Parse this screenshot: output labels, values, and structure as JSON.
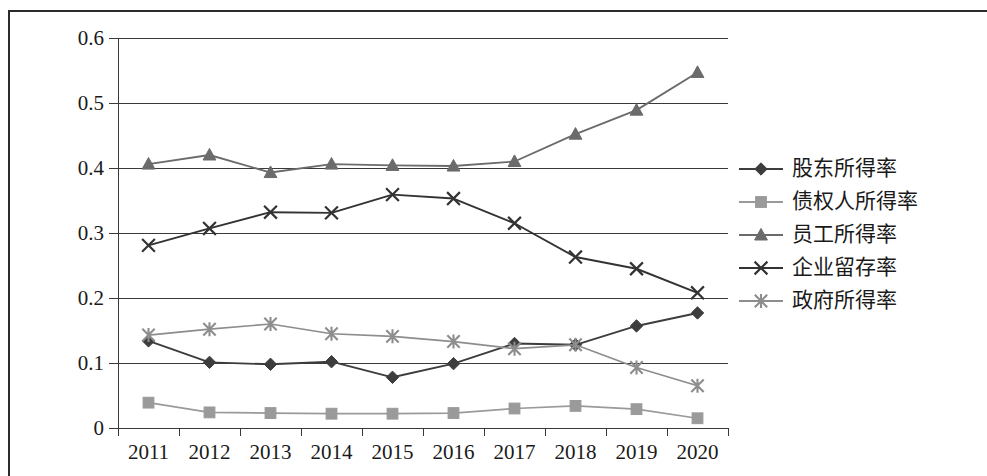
{
  "chart_data": {
    "type": "line",
    "title": "",
    "xlabel": "",
    "ylabel": "",
    "categories": [
      "2011",
      "2012",
      "2013",
      "2014",
      "2015",
      "2016",
      "2017",
      "2018",
      "2019",
      "2020"
    ],
    "ylim": [
      0,
      0.6
    ],
    "ytick_labels": [
      "0",
      "0.1",
      "0.2",
      "0.3",
      "0.4",
      "0.5",
      "0.6"
    ],
    "ytick_values": [
      0,
      0.1,
      0.2,
      0.3,
      0.4,
      0.5,
      0.6
    ],
    "grid": true,
    "legend_position": "right",
    "series": [
      {
        "name": "股东所得率",
        "marker": "diamond",
        "color": "#3d3d3d",
        "values": [
          0.134,
          0.101,
          0.098,
          0.102,
          0.078,
          0.099,
          0.13,
          0.128,
          0.157,
          0.177
        ]
      },
      {
        "name": "债权人所得率",
        "marker": "square",
        "color": "#9a9a9a",
        "values": [
          0.039,
          0.024,
          0.023,
          0.022,
          0.022,
          0.023,
          0.03,
          0.034,
          0.029,
          0.015
        ]
      },
      {
        "name": "员工所得率",
        "marker": "triangle",
        "color": "#6b6b6b",
        "values": [
          0.406,
          0.42,
          0.393,
          0.406,
          0.404,
          0.403,
          0.41,
          0.452,
          0.489,
          0.547
        ]
      },
      {
        "name": "企业留存率",
        "marker": "cross",
        "color": "#333333",
        "values": [
          0.281,
          0.307,
          0.332,
          0.331,
          0.359,
          0.353,
          0.315,
          0.263,
          0.245,
          0.208
        ]
      },
      {
        "name": "政府所得率",
        "marker": "asterisk",
        "color": "#8d8d8d",
        "values": [
          0.143,
          0.152,
          0.16,
          0.145,
          0.141,
          0.133,
          0.122,
          0.128,
          0.093,
          0.065
        ]
      }
    ]
  },
  "axes": {
    "y_labels": [
      "0.6",
      "0.5",
      "0.4",
      "0.3",
      "0.2",
      "0.1",
      "0"
    ],
    "x_labels": [
      "2011",
      "2012",
      "2013",
      "2014",
      "2015",
      "2016",
      "2017",
      "2018",
      "2019",
      "2020"
    ]
  },
  "legend": {
    "items": [
      {
        "label": "股东所得率",
        "marker": "diamond"
      },
      {
        "label": "债权人所得率",
        "marker": "square"
      },
      {
        "label": "员工所得率",
        "marker": "triangle"
      },
      {
        "label": "企业留存率",
        "marker": "cross"
      },
      {
        "label": "政府所得率",
        "marker": "asterisk"
      }
    ]
  }
}
